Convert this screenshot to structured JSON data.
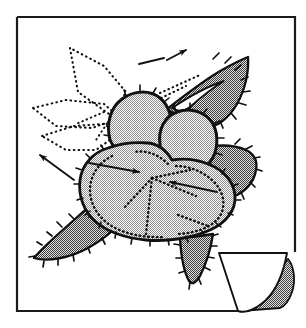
{
  "figure": {
    "style": "stippled ink illustration",
    "canvas": {
      "width": 306,
      "height": 328
    },
    "colors": {
      "ink": "#111111",
      "paper": "#ffffff",
      "light_stipple": "#d9d9d9",
      "dark_stipple": "#909090",
      "curl_shadow": "#8a8a8a",
      "frame": "#1a1a1a"
    },
    "page": {
      "frame": {
        "x": 17,
        "y": 17,
        "width": 278,
        "height": 294
      },
      "curl": {
        "name": "page-curl",
        "corner": "bottom-right",
        "flap_label": "folded page flap",
        "shadow_label": "under-page shadow"
      }
    },
    "elements": {
      "petals": [
        {
          "id": "petal-upper-left",
          "fill": "light_stipple",
          "outline": "solid"
        },
        {
          "id": "petal-upper-right",
          "fill": "light_stipple",
          "outline": "solid"
        },
        {
          "id": "petal-lower-left",
          "fill": "light_stipple",
          "outline": "dotted"
        },
        {
          "id": "petal-lower-center",
          "fill": "light_stipple",
          "outline": "dotted"
        },
        {
          "id": "petal-lower-right",
          "fill": "light_stipple",
          "outline": "dotted"
        }
      ],
      "leaves_solid": [
        {
          "id": "leaf-upper-right",
          "fill": "dark_stipple",
          "edge": "serrated",
          "has_highlight": true
        },
        {
          "id": "leaf-right",
          "fill": "dark_stipple",
          "edge": "serrated",
          "has_highlight": false
        },
        {
          "id": "leaf-lower-left",
          "fill": "dark_stipple",
          "edge": "serrated",
          "has_highlight": true
        },
        {
          "id": "leaf-bottom-center",
          "fill": "dark_stipple",
          "edge": "serrated",
          "has_highlight": false
        }
      ],
      "leaves_ghost": [
        {
          "id": "ghost-leaf-top",
          "outline": "dotted",
          "fill": "none"
        },
        {
          "id": "ghost-leaf-left",
          "outline": "dotted",
          "fill": "none"
        },
        {
          "id": "ghost-leaf-lower-left",
          "outline": "dotted",
          "fill": "none"
        }
      ],
      "leader_lines": [
        {
          "id": "leader-top-left",
          "arrow": false
        },
        {
          "id": "leader-top-right",
          "arrow": true,
          "direction": "right"
        },
        {
          "id": "leader-left",
          "arrow": true,
          "direction": "upper-left"
        },
        {
          "id": "leader-center-left",
          "arrow": true,
          "direction": "right"
        },
        {
          "id": "leader-center-right",
          "arrow": true,
          "direction": "left"
        }
      ]
    }
  }
}
